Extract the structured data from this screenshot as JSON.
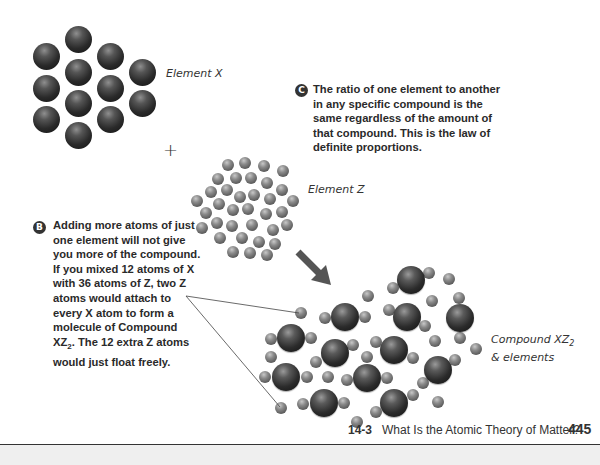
{
  "labels": {
    "element_x": "Element X",
    "element_z": "Element Z",
    "compound_line1": "Compound XZ",
    "compound_sub": "2",
    "compound_line2": "& elements",
    "plus": "+"
  },
  "callout_c": {
    "badge": "C",
    "lines": [
      "The ratio of one element to another",
      "in any specific compound is the",
      "same regardless of the amount of",
      "that compound. This is the law of",
      "definite proportions."
    ]
  },
  "callout_b": {
    "badge": "B",
    "lines": [
      "Adding more atoms of just",
      "one element will not give",
      "you more of the compound.",
      "If you mixed 12 atoms of X",
      "with 36 atoms of Z, two Z",
      "atoms would attach to",
      "every X atom to form a",
      "molecule of Compound"
    ],
    "last_line_prefix": "XZ",
    "last_line_sub": "2",
    "last_line_suffix": ". The 12 extra Z atoms",
    "final_line": "would just float freely."
  },
  "footer": {
    "section": "14-3",
    "title": "What Is the Atomic Theory of Matter?",
    "page": "445"
  },
  "colors": {
    "arrow": "#555555",
    "text": "#2a2a2a",
    "rule": "#333333"
  }
}
